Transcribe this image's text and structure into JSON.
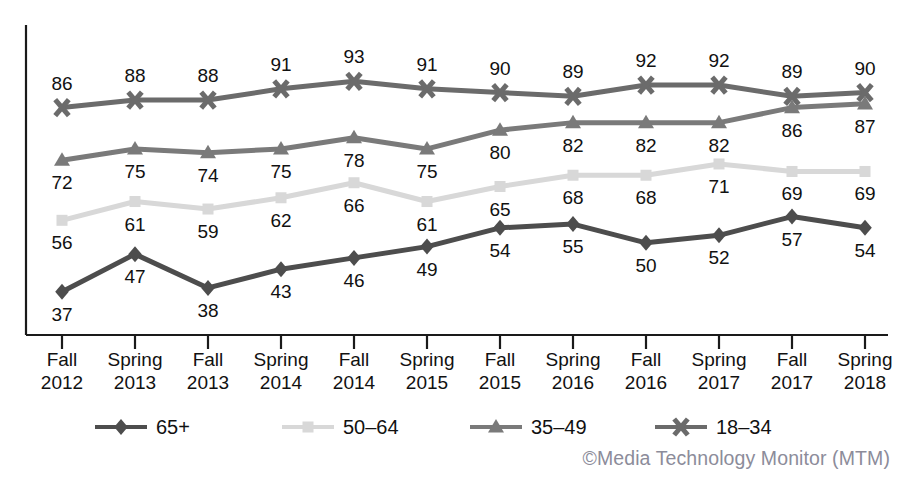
{
  "chart_data": {
    "type": "line",
    "title": "",
    "xlabel": "",
    "ylabel": "",
    "ylim": [
      30,
      100
    ],
    "grid": false,
    "legend_position": "bottom",
    "categories": [
      "Fall 2012",
      "Spring 2013",
      "Fall 2013",
      "Spring 2014",
      "Fall 2014",
      "Spring 2015",
      "Fall 2015",
      "Spring 2016",
      "Fall 2016",
      "Spring 2017",
      "Fall 2017",
      "Spring 2018"
    ],
    "tick_labels": [
      {
        "season": "Fall",
        "year": "2012"
      },
      {
        "season": "Spring",
        "year": "2013"
      },
      {
        "season": "Fall",
        "year": "2013"
      },
      {
        "season": "Spring",
        "year": "2014"
      },
      {
        "season": "Fall",
        "year": "2014"
      },
      {
        "season": "Spring",
        "year": "2015"
      },
      {
        "season": "Fall",
        "year": "2015"
      },
      {
        "season": "Spring",
        "year": "2016"
      },
      {
        "season": "Fall",
        "year": "2016"
      },
      {
        "season": "Spring",
        "year": "2017"
      },
      {
        "season": "Fall",
        "year": "2017"
      },
      {
        "season": "Spring",
        "year": "2018"
      }
    ],
    "series": [
      {
        "name": "18-34",
        "color": "#6b6b6b",
        "marker": "x-cross",
        "values": [
          86,
          88,
          88,
          91,
          93,
          91,
          90,
          89,
          92,
          92,
          89,
          90
        ],
        "label_offsets": [
          -1,
          -1,
          -1,
          -1,
          -1,
          -1,
          -1,
          -1,
          -1,
          -1,
          -1,
          -1
        ]
      },
      {
        "name": "35-49",
        "color": "#7a7a7a",
        "marker": "triangle",
        "values": [
          72,
          75,
          74,
          75,
          78,
          75,
          80,
          82,
          82,
          82,
          86,
          87
        ],
        "label_offsets": [
          1,
          1,
          1,
          1,
          1,
          1,
          1,
          1,
          1,
          1,
          1,
          1
        ]
      },
      {
        "name": "50-64",
        "color": "#d8d8d8",
        "marker": "square",
        "values": [
          56,
          61,
          59,
          62,
          66,
          61,
          65,
          68,
          68,
          71,
          69,
          69
        ],
        "label_offsets": [
          1,
          1,
          1,
          1,
          1,
          1,
          1,
          1,
          1,
          1,
          1,
          1
        ]
      },
      {
        "name": "65+",
        "color": "#4d4d4d",
        "marker": "diamond",
        "values": [
          37,
          47,
          38,
          43,
          46,
          49,
          54,
          55,
          50,
          52,
          57,
          54
        ],
        "label_offsets": [
          1,
          1,
          1,
          1,
          1,
          1,
          1,
          1,
          1,
          1,
          1,
          1
        ]
      }
    ]
  },
  "legend": {
    "items": [
      {
        "label": "65+",
        "color": "#4d4d4d",
        "marker": "diamond"
      },
      {
        "label": "50–64",
        "color": "#d8d8d8",
        "marker": "square"
      },
      {
        "label": "35–49",
        "color": "#7a7a7a",
        "marker": "triangle"
      },
      {
        "label": "18–34",
        "color": "#6b6b6b",
        "marker": "x-cross"
      }
    ]
  },
  "footer": {
    "copyright": "©Media Technology Monitor (MTM)"
  },
  "header": {
    "title_fragment": ""
  },
  "axis": {
    "axis_color": "#1a1a1a"
  }
}
